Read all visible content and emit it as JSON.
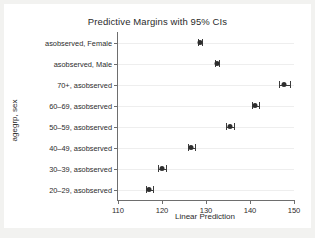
{
  "chart_data": {
    "type": "scatter",
    "title": "Predictive Margins with 95% CIs",
    "xlabel": "Linear Prediction",
    "ylabel": "agegrp, sex",
    "xlim": [
      110,
      150
    ],
    "xticks": [
      110,
      120,
      130,
      140,
      150
    ],
    "grid": true,
    "legend": "none",
    "orientation": "horizontal",
    "categories": [
      "asobserved, Female",
      "asobserved, Male",
      "70+, asobserved",
      "60–69, asobserved",
      "50–59, asobserved",
      "40–49, asobserved",
      "30–39, asobserved",
      "20–29, asobserved"
    ],
    "points": [
      {
        "label": "asobserved, Female",
        "value": 128.6,
        "ci_low": 128.1,
        "ci_high": 129.1
      },
      {
        "label": "asobserved, Male",
        "value": 132.5,
        "ci_low": 132.0,
        "ci_high": 133.0
      },
      {
        "label": "70+, asobserved",
        "value": 147.8,
        "ci_low": 146.6,
        "ci_high": 149.0
      },
      {
        "label": "60–69, asobserved",
        "value": 141.2,
        "ci_low": 140.4,
        "ci_high": 142.0
      },
      {
        "label": "50–59, asobserved",
        "value": 135.5,
        "ci_low": 134.6,
        "ci_high": 136.4
      },
      {
        "label": "40–49, asobserved",
        "value": 126.7,
        "ci_low": 125.9,
        "ci_high": 127.5
      },
      {
        "label": "30–39, asobserved",
        "value": 120.1,
        "ci_low": 119.2,
        "ci_high": 121.0
      },
      {
        "label": "20–29, asobserved",
        "value": 117.1,
        "ci_low": 116.3,
        "ci_high": 117.9
      }
    ],
    "marker_color": "#2e2e2e",
    "axis_color": "#6e6e6e",
    "grid_color": "#eeeeee",
    "plot_background": "#ffffff",
    "figure_background": "#f2f2f0"
  }
}
